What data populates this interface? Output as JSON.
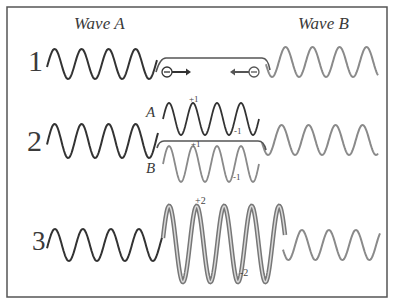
{
  "titles": {
    "wave_a": "Wave A",
    "wave_b": "Wave B"
  },
  "rows": [
    {
      "number": "1",
      "description": "Two waves approaching each other; negative charges moving toward each other"
    },
    {
      "number": "2",
      "description": "Waves A and B overlap",
      "sub_labels": {
        "a": "A",
        "b": "B"
      },
      "amplitudes": {
        "a_top": "+1",
        "a_bottom": "-1",
        "b_top": "+1",
        "b_bottom": "-1"
      }
    },
    {
      "number": "3",
      "description": "Constructive interference",
      "amplitudes": {
        "top": "+2",
        "bottom": "-2"
      }
    }
  ],
  "symbols": {
    "charge": "⊖",
    "arrow_right": "⟶",
    "arrow_left": "⟵"
  },
  "colors": {
    "wave_a": "#333333",
    "wave_b": "#8a8a8a",
    "frame": "#555555",
    "combined_outer": "#777777",
    "combined_inner": "#d8d8d8"
  }
}
